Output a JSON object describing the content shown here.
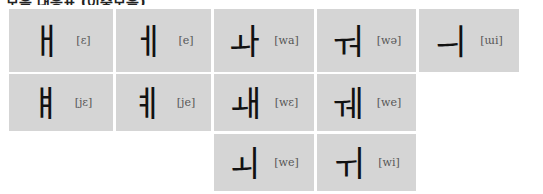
{
  "title": "모음 대응표 (이중모음)",
  "layout": {
    "cols_x": [
      9,
      116,
      214,
      317,
      419
    ],
    "cols_w": [
      104,
      95,
      100,
      99,
      100
    ],
    "rows_y": [
      9,
      74,
      134
    ],
    "rows_h": [
      63,
      57,
      57
    ],
    "background": "#d5d5d5",
    "ipa_color": "#555555",
    "glyph_color": "#111111"
  },
  "cells": [
    {
      "row": 0,
      "col": 0,
      "glyph": "ㅐ",
      "ipa": "[ɛ]"
    },
    {
      "row": 0,
      "col": 1,
      "glyph": "ㅔ",
      "ipa": "[e]"
    },
    {
      "row": 0,
      "col": 2,
      "glyph": "ㅘ",
      "ipa": "[wa]"
    },
    {
      "row": 0,
      "col": 3,
      "glyph": "ㅝ",
      "ipa": "[wə]"
    },
    {
      "row": 0,
      "col": 4,
      "glyph": "ㅢ",
      "ipa": "[ɯi]"
    },
    {
      "row": 1,
      "col": 0,
      "glyph": "ㅒ",
      "ipa": "[jɛ]"
    },
    {
      "row": 1,
      "col": 1,
      "glyph": "ㅖ",
      "ipa": "[je]"
    },
    {
      "row": 1,
      "col": 2,
      "glyph": "ㅙ",
      "ipa": "[wɛ]"
    },
    {
      "row": 1,
      "col": 3,
      "glyph": "ㅞ",
      "ipa": "[we]"
    },
    {
      "row": 2,
      "col": 2,
      "glyph": "ㅚ",
      "ipa": "[we]"
    },
    {
      "row": 2,
      "col": 3,
      "glyph": "ㅟ",
      "ipa": "[wi]"
    }
  ]
}
